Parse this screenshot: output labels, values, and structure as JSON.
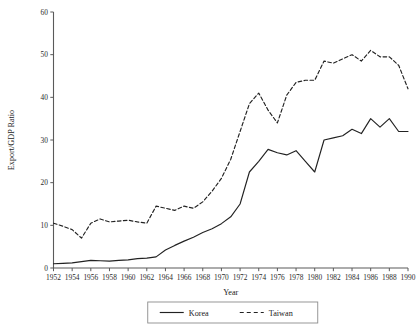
{
  "chart_data": {
    "type": "line",
    "title": "",
    "xlabel": "Year",
    "ylabel": "Export/GDP Ratio",
    "xlim": [
      1952,
      1990
    ],
    "ylim": [
      0,
      60
    ],
    "grid": false,
    "legend_position": "bottom-center",
    "y_ticks": [
      0,
      10,
      20,
      30,
      40,
      50,
      60
    ],
    "x_ticks": [
      1952,
      1954,
      1956,
      1958,
      1960,
      1962,
      1964,
      1966,
      1968,
      1970,
      1972,
      1974,
      1976,
      1978,
      1980,
      1982,
      1984,
      1986,
      1988,
      1990
    ],
    "x": [
      1952,
      1953,
      1954,
      1955,
      1956,
      1957,
      1958,
      1959,
      1960,
      1961,
      1962,
      1963,
      1964,
      1965,
      1966,
      1967,
      1968,
      1969,
      1970,
      1971,
      1972,
      1973,
      1974,
      1975,
      1976,
      1977,
      1978,
      1979,
      1980,
      1981,
      1982,
      1983,
      1984,
      1985,
      1986,
      1987,
      1988,
      1989,
      1990
    ],
    "series": [
      {
        "name": "Korea",
        "style": "solid",
        "values": [
          1.0,
          1.1,
          1.2,
          1.5,
          1.8,
          1.7,
          1.6,
          1.8,
          1.9,
          2.2,
          2.3,
          2.6,
          4.2,
          5.3,
          6.3,
          7.2,
          8.3,
          9.2,
          10.4,
          12.0,
          15.0,
          22.5,
          25.0,
          27.8,
          27.0,
          26.5,
          27.5,
          25.0,
          22.5,
          30.0,
          30.5,
          31.0,
          32.5,
          31.5,
          35.0,
          33.0,
          35.0,
          32.0,
          32.0
        ],
        "peak_value": 35.0,
        "peak_year": 1986,
        "end_value": 32.0
      },
      {
        "name": "Taiwan",
        "style": "dashed",
        "values": [
          10.5,
          9.8,
          9.0,
          7.0,
          10.5,
          11.5,
          10.8,
          11.0,
          11.2,
          10.8,
          10.5,
          14.5,
          14.0,
          13.5,
          14.5,
          14.0,
          15.5,
          18.0,
          21.0,
          25.5,
          32.0,
          38.5,
          41.0,
          37.0,
          34.0,
          40.5,
          43.5,
          44.0,
          44.0,
          48.5,
          48.0,
          49.0,
          50.0,
          48.5,
          51.0,
          49.5,
          49.5,
          47.5,
          42.0
        ],
        "peak_value": 51.0,
        "peak_year": 1986,
        "end_value": 42.0
      }
    ]
  },
  "legend": {
    "items": [
      {
        "label": "Korea",
        "style": "solid"
      },
      {
        "label": "Taiwan",
        "style": "dashed"
      }
    ]
  }
}
